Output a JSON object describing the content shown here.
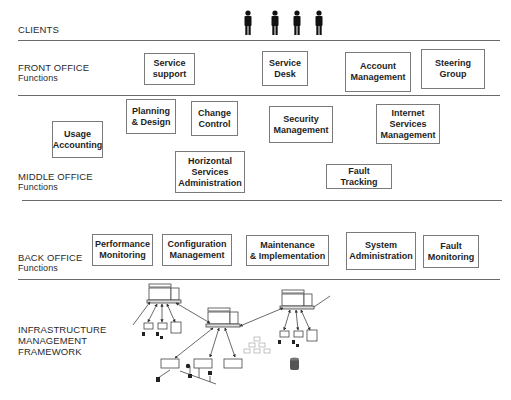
{
  "diagram": {
    "sections": [
      {
        "id": "clients",
        "title": "CLIENTS",
        "subtitle": ""
      },
      {
        "id": "front_office",
        "title": "FRONT OFFICE",
        "subtitle": "Functions"
      },
      {
        "id": "middle_office",
        "title": "MIDDLE OFFICE",
        "subtitle": "Functions"
      },
      {
        "id": "back_office",
        "title": "BACK OFFICE",
        "subtitle": "Functions"
      },
      {
        "id": "infrastructure",
        "title": "INFRASTRUCTURE\nMANAGEMENT\nFRAMEWORK",
        "subtitle": ""
      }
    ],
    "clients": {
      "count": 4,
      "icon": "person-icon"
    },
    "front_office_boxes": [
      {
        "label": "Service\nsupport"
      },
      {
        "label": "Service\nDesk"
      },
      {
        "label": "Account\nManagement"
      },
      {
        "label": "Steering\nGroup"
      }
    ],
    "middle_office_boxes": [
      {
        "label": "Planning\n& Design"
      },
      {
        "label": "Change\nControl"
      },
      {
        "label": "Security\nManagement"
      },
      {
        "label": "Internet\nServices\nManagement"
      },
      {
        "label": "Usage\nAccounting"
      },
      {
        "label": "Horizontal\nServices\nAdministration"
      },
      {
        "label": "Fault Tracking"
      }
    ],
    "back_office_boxes": [
      {
        "label": "Performance\nMonitoring"
      },
      {
        "label": "Configuration\nManagement"
      },
      {
        "label": "Maintenance\n& Implementation"
      },
      {
        "label": "System\nAdministration"
      },
      {
        "label": "Fault\nMonitoring"
      }
    ],
    "infrastructure_icons": [
      "server-icon",
      "workstation-icon",
      "printer-icon",
      "network-bus-icon",
      "hierarchy-icon",
      "database-icon"
    ]
  }
}
